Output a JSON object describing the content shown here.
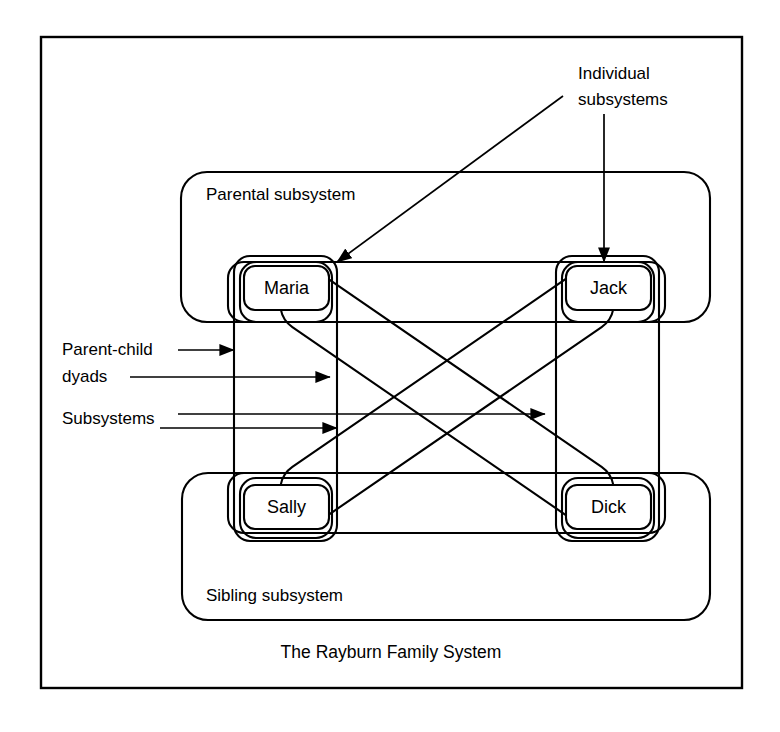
{
  "figure": {
    "caption": "The Rayburn Family System",
    "members": [
      {
        "id": "maria",
        "label": "Maria",
        "role": "parent",
        "x": 282,
        "y": 288
      },
      {
        "id": "jack",
        "label": "Jack",
        "role": "parent",
        "x": 604,
        "y": 288
      },
      {
        "id": "sally",
        "label": "Sally",
        "role": "child",
        "x": 287,
        "y": 507
      },
      {
        "id": "dick",
        "label": "Dick",
        "role": "child",
        "x": 604,
        "y": 507
      }
    ],
    "groups": [
      {
        "id": "parental",
        "label": "Parental subsystem",
        "label_x": 206,
        "label_y": 200
      },
      {
        "id": "sibling",
        "label": "Sibling subsystem",
        "label_x": 206,
        "label_y": 601
      }
    ],
    "annotations": [
      {
        "id": "individual-subsystems",
        "line1": "Individual",
        "line2": "subsystems",
        "x": 578,
        "y": 79,
        "anchor": "start"
      },
      {
        "id": "parent-child-dyads",
        "line1": "Parent-child",
        "line2": "dyads",
        "x": 62,
        "y": 355,
        "anchor": "start"
      },
      {
        "id": "subsystems",
        "line1": "Subsystems",
        "line2": "",
        "x": 62,
        "y": 424,
        "anchor": "start"
      }
    ],
    "colors": {
      "stroke": "#000000",
      "background": "#ffffff",
      "text": "#000000"
    },
    "frame": {
      "x": 41,
      "y": 37,
      "width": 701,
      "height": 651
    }
  }
}
